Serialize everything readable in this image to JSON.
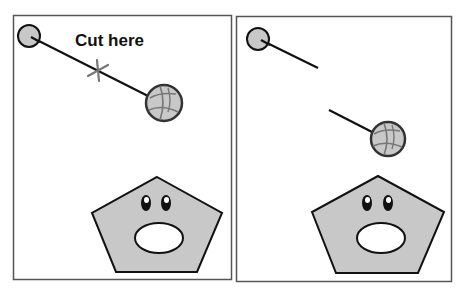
{
  "panels": [
    {
      "id": "before",
      "label": "Cut here",
      "state": "intact string with cut marker"
    },
    {
      "id": "after",
      "label": "",
      "state": "string cut, ball falling toward pentagon"
    }
  ],
  "colors": {
    "background": "#ffffff",
    "panel_border": "#555555",
    "shape_fill": "#c8c8c8",
    "stroke": "#111111",
    "cut_marker": "#777777",
    "ball_lines": "#777777"
  }
}
